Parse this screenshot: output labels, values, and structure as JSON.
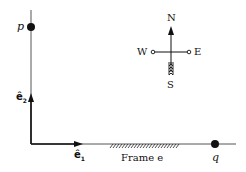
{
  "diagram": {
    "points": {
      "p": {
        "label": "p"
      },
      "q": {
        "label": "q"
      }
    },
    "basis": {
      "e1": {
        "label": "ê",
        "sub": "1"
      },
      "e2": {
        "label": "ê",
        "sub": "2"
      }
    },
    "frame_label": "Frame e",
    "compass": {
      "north": "N",
      "south": "S",
      "east": "E",
      "west": "W"
    },
    "colors": {
      "ink": "#111111",
      "background": "#ffffff",
      "axis_line": "#555555"
    }
  }
}
